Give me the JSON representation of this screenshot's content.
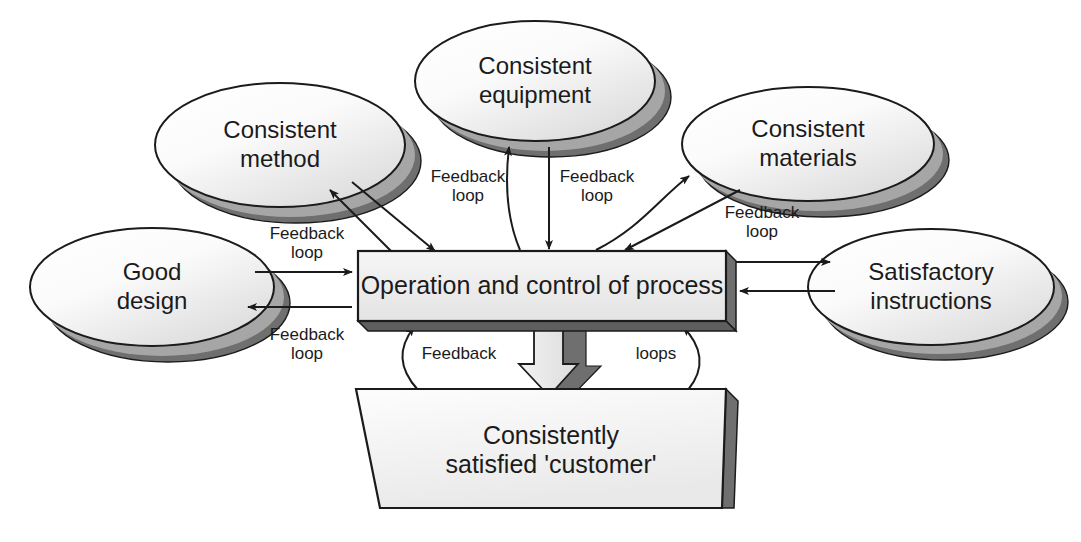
{
  "diagram": {
    "colors": {
      "stroke": "#1b1b1b",
      "ellipse_face_light": "#ffffff",
      "ellipse_face_shade": "#e4e4e4",
      "ellipse_shadow_dark": "#6e6e6e",
      "ellipse_shadow_mid": "#a9a9a9",
      "box_face": "#eeeeee",
      "box_shadow": "#6e6e6e",
      "block_arrow_face": "#e2e2e2",
      "block_arrow_shadow": "#6e6e6e",
      "background": "#ffffff"
    },
    "inputs": [
      {
        "id": "consistent-method",
        "label_line1": "Consistent",
        "label_line2": "method",
        "cx": 280,
        "cy": 145,
        "rx": 125,
        "ry": 62
      },
      {
        "id": "consistent-equipment",
        "label_line1": "Consistent",
        "label_line2": "equipment",
        "cx": 535,
        "cy": 81,
        "rx": 120,
        "ry": 60
      },
      {
        "id": "consistent-materials",
        "label_line1": "Consistent",
        "label_line2": "materials",
        "cx": 808,
        "cy": 144,
        "rx": 126,
        "ry": 57
      },
      {
        "id": "good-design",
        "label_line1": "Good",
        "label_line2": "design",
        "cx": 152,
        "cy": 287,
        "rx": 122,
        "ry": 59
      },
      {
        "id": "satisfactory-instructions",
        "label_line1": "Satisfactory",
        "label_line2": "instructions",
        "cx": 931,
        "cy": 287,
        "rx": 123,
        "ry": 58
      }
    ],
    "process_box": {
      "id": "operation-and-control-of-process",
      "label": "Operation and control of process",
      "x": 358,
      "y": 251,
      "width": 368,
      "height": 70,
      "depth": 10
    },
    "customer_box": {
      "id": "consistently-satisfied-customer",
      "label_line1": "Consistently",
      "label_line2": "satisfied 'customer'",
      "top_left_x": 356,
      "top_right_x": 726,
      "bottom_left_x": 380,
      "bottom_right_x": 722,
      "top_y": 389,
      "bottom_y": 508,
      "depth": 12
    },
    "loop_labels": [
      {
        "id": "loop-method",
        "line1": "Feedback",
        "line2": "loop",
        "x": 307,
        "y": 244
      },
      {
        "id": "loop-equipment-left",
        "line1": "Feedback",
        "line2": "loop",
        "x": 468,
        "y": 187
      },
      {
        "id": "loop-equipment-right",
        "line1": "Feedback",
        "line2": "loop",
        "x": 597,
        "y": 187
      },
      {
        "id": "loop-materials",
        "line1": "Feedback",
        "line2": "loop",
        "x": 762,
        "y": 223
      },
      {
        "id": "loop-good-design",
        "line1": "Feedback",
        "line2": "loop",
        "x": 307,
        "y": 345
      },
      {
        "id": "loop-feedback-left",
        "line1": "Feedback",
        "line2": "",
        "x": 459,
        "y": 355
      },
      {
        "id": "loop-loops-right",
        "line1": "loops",
        "line2": "",
        "x": 656,
        "y": 355
      }
    ]
  }
}
